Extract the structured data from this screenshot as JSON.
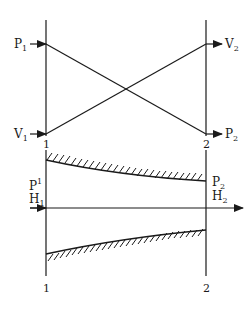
{
  "diagram": {
    "top": {
      "left_in_1": {
        "main": "P",
        "sub": "1"
      },
      "left_in_2": {
        "main": "V",
        "sub": "1"
      },
      "right_out_1": {
        "main": "V",
        "sub": "2"
      },
      "right_out_2": {
        "main": "P",
        "sub": "2"
      },
      "station_left": "1",
      "station_right": "2"
    },
    "bottom": {
      "inlet_labels": [
        {
          "main": "P",
          "sub": "1"
        },
        {
          "main": "H",
          "sub": "1"
        }
      ],
      "outlet_labels": [
        {
          "main": "P",
          "sub": "2"
        },
        {
          "main": "H",
          "sub": "2"
        }
      ],
      "station_left_top": "1",
      "station_right_top": "2",
      "station_left_bottom": "1",
      "station_right_bottom": "2"
    },
    "colors": {
      "ink": "#1a1a1a",
      "background": "#ffffff"
    }
  }
}
